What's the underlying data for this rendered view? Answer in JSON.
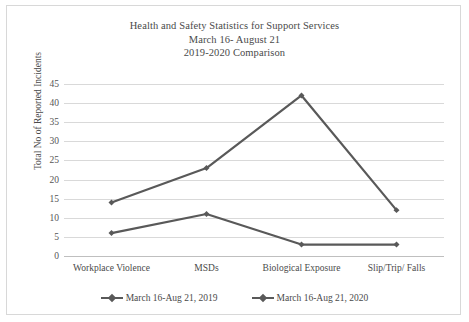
{
  "chart_data": {
    "type": "line",
    "title": "Health and Safety Statistics for Support Services",
    "subtitle_line2": "March 16- August 21",
    "subtitle_line3": "2019-2020 Comparison",
    "xlabel": "",
    "ylabel": "Total No of Reported Incidents",
    "categories": [
      "Workplace Violence",
      "MSDs",
      "Biological Exposure",
      "Slip/Trip/ Falls"
    ],
    "ylim": [
      0,
      45
    ],
    "ytick_step": 5,
    "yticks": [
      0,
      5,
      10,
      15,
      20,
      25,
      30,
      35,
      40,
      45
    ],
    "grid": true,
    "legend_position": "bottom",
    "series": [
      {
        "name": "March 16-Aug 21, 2019",
        "values": [
          6,
          11,
          3,
          3
        ],
        "color": "#595959"
      },
      {
        "name": "March 16-Aug 21, 2020",
        "values": [
          14,
          23,
          42,
          12
        ],
        "color": "#595959"
      }
    ]
  },
  "style": {
    "line_color": "#595959",
    "grid_color": "#d9d9d9",
    "text_color": "#4a4a4a",
    "frame_color": "#d8d8d8",
    "background": "#ffffff"
  }
}
